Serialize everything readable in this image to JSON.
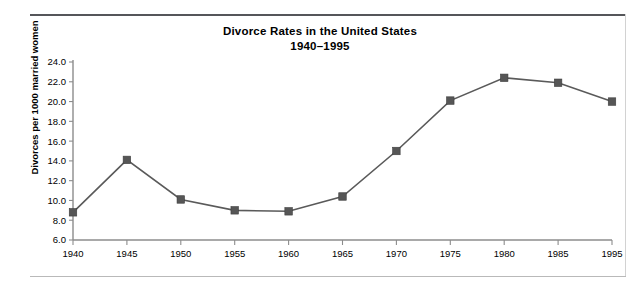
{
  "document": {
    "title_line_1": "Divorce Rates in the United States",
    "title_line_2": "1940–1995"
  },
  "chart_data": {
    "type": "line",
    "title": "Divorce Rates in the United States 1940–1995",
    "title_line_1": "Divorce Rates in the United States",
    "title_line_2": "1940–1995",
    "xlabel": "",
    "ylabel": "Divorces per 1000 married women",
    "x": [
      1940,
      1945,
      1950,
      1955,
      1960,
      1965,
      1970,
      1975,
      1980,
      1985,
      1995
    ],
    "values": [
      8.8,
      14.1,
      10.1,
      9.0,
      8.9,
      10.4,
      15.0,
      20.1,
      22.4,
      21.9,
      20.0
    ],
    "xtick_labels": [
      "1940",
      "1945",
      "1950",
      "1955",
      "1960",
      "1965",
      "1970",
      "1975",
      "1980",
      "1985",
      "1995"
    ],
    "ytick_labels": [
      "6.0",
      "8.0",
      "10.0",
      "12.0",
      "14.0",
      "16.0",
      "18.0",
      "20.0",
      "22.0",
      "24.0"
    ],
    "ytick_values": [
      6.0,
      8.0,
      10.0,
      12.0,
      14.0,
      16.0,
      18.0,
      20.0,
      22.0,
      24.0
    ],
    "ylim": [
      6.0,
      24.0
    ],
    "xlim": [
      1940,
      1995
    ],
    "grid": false,
    "legend": false,
    "marker": "square",
    "line_color": "#5a5a5a",
    "marker_color": "#565656",
    "axis_color": "#8c8c8c",
    "background_color": "#ffffff"
  }
}
